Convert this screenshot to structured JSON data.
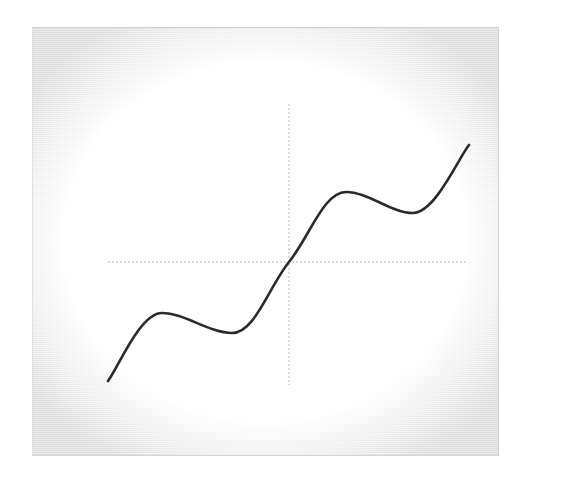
{
  "chart_data": {
    "type": "line",
    "title": "",
    "xlabel": "",
    "ylabel": "",
    "grid": false,
    "legend": null,
    "axes": {
      "style": "dotted",
      "color": "#b0b0b0",
      "through_origin": true,
      "xlim": [
        -9.42,
        9.42
      ],
      "ylim": [
        -10.5,
        10.5
      ]
    },
    "series": [
      {
        "name": "curve",
        "color": "#2a2a2a",
        "description": "staircase-like wave, approximately y = x + 2.5*sin(x)",
        "x": [
          -9.42,
          -8.5,
          -7.5,
          -6.5,
          -5.6,
          -4.6,
          -3.8,
          -3.14,
          -2.5,
          -1.5,
          -0.75,
          0,
          0.75,
          1.5,
          2.5,
          3.14,
          3.8,
          4.6,
          5.6,
          6.5,
          7.5,
          8.5,
          9.42
        ],
        "y": [
          -9.42,
          -6.6,
          -5.1,
          -5.9,
          -7.1,
          -7.8,
          -6.3,
          -3.14,
          -1.3,
          -1.6,
          -2.45,
          0,
          2.45,
          1.6,
          1.3,
          3.14,
          6.3,
          7.8,
          7.1,
          5.9,
          5.1,
          6.6,
          9.42
        ]
      }
    ],
    "pixel_anchors": {
      "origin": [
        289,
        262
      ],
      "start": [
        108,
        381
      ],
      "local_max_left": [
        162,
        313
      ],
      "local_min_left": [
        232,
        333
      ],
      "local_max_right": [
        346,
        192
      ],
      "local_min_right": [
        413,
        213
      ],
      "end": [
        469,
        145
      ]
    }
  }
}
